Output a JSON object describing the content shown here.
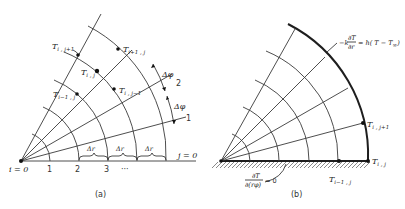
{
  "figure_a": {
    "caption": "(a)",
    "origin_label": "i = 0",
    "r_ticks": [
      "1",
      "2",
      "3",
      "···"
    ],
    "j_labels": {
      "j0": "j = 0",
      "j1": "1",
      "j2": "2"
    },
    "delta_r": "Δr",
    "delta_phi": "Δφ",
    "nodes": {
      "i_jp1": {
        "T": "T",
        "sub": "i , j+1"
      },
      "ip1_j": {
        "T": "T",
        "sub": "i+1 , j"
      },
      "i_j": {
        "T": "T",
        "sub": "i , j"
      },
      "i_jm1": {
        "T": "T",
        "sub": "i , j−1"
      },
      "im1_j": {
        "T": "T",
        "sub": "i−1 , j"
      }
    }
  },
  "figure_b": {
    "caption": "(b)",
    "convection_bc": "−k ∂T/∂r = h(T − T∞)",
    "convection_lhs": "−k",
    "convection_num": "∂T",
    "convection_den": "∂r",
    "convection_rhs": "= h( T − T",
    "convection_inf": "∞",
    "convection_close": ")",
    "insulated_num": "∂T",
    "insulated_den": "∂(rφ)",
    "insulated_rhs": "= 0",
    "nodes": {
      "i_jp1": {
        "T": "T",
        "sub": "i , j+1"
      },
      "i_j": {
        "T": "T",
        "sub": "i , j"
      },
      "im1_j": {
        "T": "T",
        "sub": "i−1 , j"
      }
    }
  }
}
